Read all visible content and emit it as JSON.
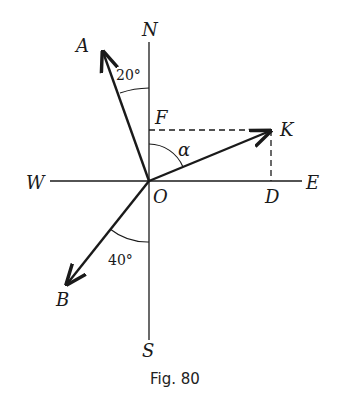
{
  "figure": {
    "caption": "Fig. 80",
    "labels": {
      "north": "N",
      "south": "S",
      "east": "E",
      "west": "W",
      "origin": "O",
      "point_a": "A",
      "point_b": "B",
      "point_k": "K",
      "point_d": "D",
      "point_f": "F",
      "alpha": "α"
    },
    "angles": {
      "a_from_north": "20°",
      "b_from_south": "40°"
    },
    "colors": {
      "ink": "#1a1a1a",
      "background": "#ffffff"
    }
  }
}
